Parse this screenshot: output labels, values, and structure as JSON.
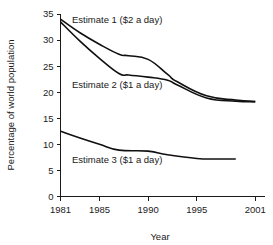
{
  "chart_data": {
    "type": "line",
    "title": "",
    "xlabel": "Year",
    "ylabel": "Percentage of world population",
    "xlim": [
      1981,
      2002
    ],
    "ylim": [
      0,
      35
    ],
    "grid": false,
    "legend_position": "inline-annotations",
    "x_ticks": [
      "1981",
      "1985",
      "1990",
      "1995",
      "2001"
    ],
    "x_tick_values": [
      1981,
      1985,
      1990,
      1995,
      2001
    ],
    "y_ticks": [
      "0",
      "5",
      "10",
      "15",
      "20",
      "25",
      "30",
      "35"
    ],
    "y_tick_values": [
      0,
      5,
      10,
      15,
      20,
      25,
      30,
      35
    ],
    "line_color": "#101010",
    "series": [
      {
        "name": "Estimate 1 ($2 a day)",
        "annotation": "Estimate 1 ($2 a day)",
        "x": [
          1981,
          1983,
          1985,
          1987,
          1988,
          1990,
          1992,
          1993,
          1996,
          1999,
          2001
        ],
        "values": [
          34.0,
          31.4,
          29.2,
          27.3,
          27.0,
          26.3,
          23.4,
          22.0,
          19.3,
          18.5,
          18.2
        ]
      },
      {
        "name": "Estimate 2 ($1 a day)",
        "annotation": "Estimate 2 ($1 a day)",
        "x": [
          1981,
          1983,
          1985,
          1987,
          1988,
          1990,
          1992,
          1993,
          1996,
          1999,
          2001
        ],
        "values": [
          33.5,
          29.8,
          26.5,
          23.6,
          23.3,
          22.9,
          22.3,
          21.4,
          18.9,
          18.3,
          18.2
        ]
      },
      {
        "name": "Estimate 3 ($1 a day)",
        "annotation": "Estimate 3 ($1 a day)",
        "x": [
          1981,
          1983,
          1985,
          1987,
          1990,
          1992,
          1995,
          1997,
          1999
        ],
        "values": [
          12.5,
          11.2,
          10.0,
          8.9,
          8.7,
          8.0,
          7.3,
          7.2,
          7.2
        ]
      }
    ]
  },
  "annotations": {
    "estimate1": "Estimate 1 ($2 a day)",
    "estimate2": "Estimate 2 ($1 a day)",
    "estimate3": "Estimate 3 ($1 a day)"
  },
  "axes": {
    "x_title": "Year",
    "y_title": "Percentage of world population",
    "x_tick_labels": [
      "1981",
      "1985",
      "1990",
      "1995",
      "2001"
    ],
    "y_tick_labels": [
      "0",
      "5",
      "10",
      "15",
      "20",
      "25",
      "30",
      "35"
    ]
  }
}
